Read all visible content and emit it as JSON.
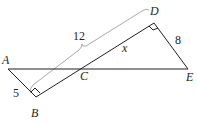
{
  "diagram": {
    "type": "geometry",
    "points": {
      "A": {
        "label": "A",
        "x": 8,
        "y": 69
      },
      "B": {
        "label": "B",
        "x": 36,
        "y": 97
      },
      "C": {
        "label": "C",
        "x": 84,
        "y": 69
      },
      "D": {
        "label": "D",
        "x": 154,
        "y": 23
      },
      "E": {
        "label": "E",
        "x": 188,
        "y": 69
      }
    },
    "segments": [
      {
        "from": "A",
        "to": "E"
      },
      {
        "from": "A",
        "to": "B"
      },
      {
        "from": "B",
        "to": "D"
      },
      {
        "from": "D",
        "to": "E"
      }
    ],
    "right_angles": [
      "B",
      "D"
    ],
    "measurements": {
      "AB": "5",
      "DE": "8",
      "BD": "12",
      "CD": "x"
    },
    "colors": {
      "line": "#231f20",
      "brace": "#a7a9ac"
    }
  }
}
